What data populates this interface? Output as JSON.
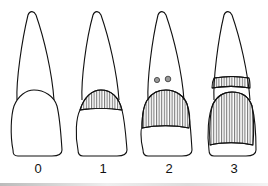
{
  "figure": {
    "type": "tooth-scoring-diagram",
    "teeth": [
      {
        "label": "0",
        "description": "intact tooth, no hatching"
      },
      {
        "label": "1",
        "description": "hatched band at crown top"
      },
      {
        "label": "2",
        "description": "two spots on root, upper crown hatched"
      },
      {
        "label": "3",
        "description": "hatched band on root, crown mostly hatched"
      }
    ]
  }
}
